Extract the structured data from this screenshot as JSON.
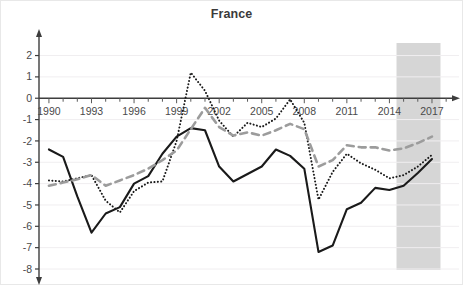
{
  "chart_data": {
    "type": "line",
    "title": "France",
    "xlabel": "",
    "ylabel": "",
    "xlim": [
      1989.3,
      2018.2
    ],
    "ylim": [
      -8,
      2.4
    ],
    "grid": true,
    "grid_axis": "y",
    "legend_position": "none",
    "yticks": [
      2,
      1,
      0,
      -1,
      -2,
      -3,
      -4,
      -5,
      -6,
      -7,
      -8
    ],
    "ytick_labels": [
      "2",
      "1",
      "0",
      "-1",
      "-2",
      "-3",
      "-4",
      "-5",
      "-6",
      "-7",
      "-8"
    ],
    "xticks": [
      1990,
      1993,
      1996,
      1999,
      2002,
      2005,
      2008,
      2011,
      2014,
      2017
    ],
    "xtick_labels": [
      "1990",
      "1993",
      "1996",
      "1999",
      "2002",
      "2005",
      "2008",
      "2011",
      "2014",
      "2017"
    ],
    "xtick_minor_step": 1,
    "x": [
      1990,
      1991,
      1992,
      1993,
      1994,
      1995,
      1996,
      1997,
      1998,
      1999,
      2000,
      2001,
      2002,
      2003,
      2004,
      2005,
      2006,
      2007,
      2008,
      2009,
      2010,
      2011,
      2012,
      2013,
      2014,
      2015,
      2016,
      2017
    ],
    "series": [
      {
        "name": "solid-black-series",
        "style": "solid",
        "color": "#1a1a1a",
        "width": 2.1,
        "values": [
          -2.4,
          -2.75,
          -4.6,
          -6.3,
          -5.4,
          -5.1,
          -4.0,
          -3.65,
          -2.6,
          -1.8,
          -1.4,
          -1.5,
          -3.2,
          -3.9,
          -3.55,
          -3.2,
          -2.4,
          -2.7,
          -3.3,
          -7.2,
          -6.9,
          -5.2,
          -4.9,
          -4.2,
          -4.3,
          -4.1,
          -3.5,
          -2.85
        ]
      },
      {
        "name": "dotted-black-series",
        "style": "dotted",
        "color": "#1a1a1a",
        "width": 2.0,
        "values": [
          -3.85,
          -3.9,
          -3.75,
          -3.6,
          -4.8,
          -5.35,
          -4.35,
          -3.95,
          -3.9,
          -2.0,
          1.2,
          0.35,
          -1.05,
          -1.8,
          -1.15,
          -1.35,
          -0.95,
          -0.05,
          -1.15,
          -4.75,
          -3.45,
          -2.6,
          -3.05,
          -3.35,
          -3.75,
          -3.6,
          -3.2,
          -2.65
        ]
      },
      {
        "name": "gray-dashed-series",
        "style": "dashed",
        "color": "#9c9c9c",
        "width": 2.6,
        "values": [
          -4.1,
          -3.95,
          -3.8,
          -3.6,
          -4.1,
          -3.85,
          -3.6,
          -3.3,
          -2.9,
          -2.45,
          -1.45,
          -0.45,
          -1.35,
          -1.75,
          -1.6,
          -1.75,
          -1.5,
          -1.2,
          -1.45,
          -3.2,
          -2.9,
          -2.2,
          -2.3,
          -2.3,
          -2.45,
          -2.35,
          -2.1,
          -1.8
        ]
      }
    ],
    "shaded_region": {
      "name": "forecast-band",
      "x_start": 2014.5,
      "x_end": 2017.6,
      "color": "#cfcfcf"
    }
  }
}
